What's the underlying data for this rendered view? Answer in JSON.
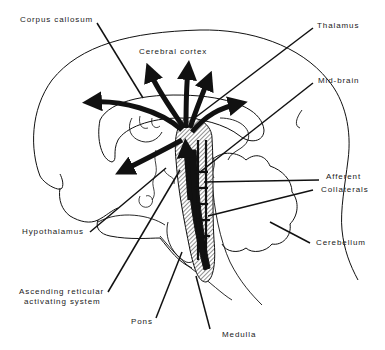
{
  "diagram": {
    "colors": {
      "ink": "#111111",
      "hatch": "#555555",
      "background": "#ffffff"
    },
    "labels": {
      "corpus_callosum": "Corpus callosum",
      "cerebral_cortex": "Cerebral cortex",
      "thalamus": "Thalamus",
      "mid_brain": "Mid-brain",
      "afferent": "Afferent",
      "collaterals": "Collaterals",
      "cerebellum": "Cerebellum",
      "hypothalamus": "Hypothalamus",
      "aras_line1": "Ascending reticular",
      "aras_line2": "activating system",
      "pons": "Pons",
      "medulla": "Medulla"
    }
  }
}
